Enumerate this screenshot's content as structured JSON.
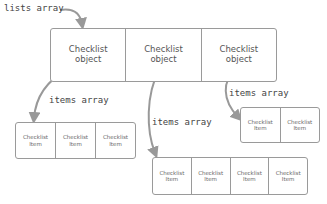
{
  "labels": {
    "lists_array": "lists array",
    "items_array_left": "items array",
    "items_array_middle": "items array",
    "items_array_right": "items array"
  },
  "lists_box": {
    "cells": [
      {
        "line1": "Checklist",
        "line2": "object"
      },
      {
        "line1": "Checklist",
        "line2": "object"
      },
      {
        "line1": "Checklist",
        "line2": "object"
      }
    ]
  },
  "items_left": {
    "cells": [
      {
        "line1": "Checklist",
        "line2": "Item"
      },
      {
        "line1": "Checklist",
        "line2": "Item"
      },
      {
        "line1": "Checklist",
        "line2": "Item"
      }
    ]
  },
  "items_middle": {
    "cells": [
      {
        "line1": "Checklist",
        "line2": "Item"
      },
      {
        "line1": "Checklist",
        "line2": "Item"
      },
      {
        "line1": "Checklist",
        "line2": "Item"
      },
      {
        "line1": "Checklist",
        "line2": "Item"
      }
    ]
  },
  "items_right": {
    "cells": [
      {
        "line1": "Checklist",
        "line2": "Item"
      },
      {
        "line1": "Checklist",
        "line2": "Item"
      }
    ]
  },
  "colors": {
    "border": "#9a9a9a",
    "arrow": "#999999",
    "text": "#555555"
  }
}
